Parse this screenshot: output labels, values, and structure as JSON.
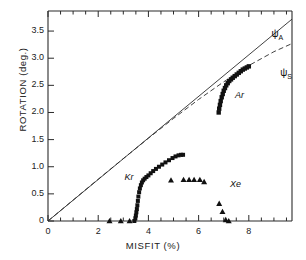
{
  "chart_data": {
    "type": "scatter",
    "title": "",
    "xlabel": "MISFIT (%)",
    "ylabel": "ROTATION (deg.)",
    "xlim": [
      0,
      9.72
    ],
    "ylim": [
      0,
      3.87
    ],
    "xticks_major": [
      0,
      2,
      4,
      6,
      8
    ],
    "xticks_major_labels": [
      "0",
      "2",
      "4",
      "6",
      "8"
    ],
    "xticks_minor": [
      0.5,
      1,
      1.5,
      2.5,
      3,
      3.5,
      4.5,
      5,
      5.5,
      6.5,
      7,
      7.5,
      8.5,
      9,
      9.5
    ],
    "yticks_major": [
      0,
      0.5,
      1.0,
      1.5,
      2.0,
      2.5,
      3.0,
      3.5
    ],
    "yticks_major_labels": [
      "0",
      "0.5",
      "1.0",
      "1.5",
      "2.0",
      "2.5",
      "3.0",
      "3.5"
    ],
    "grid": false,
    "legend": "inline-annotations",
    "series": [
      {
        "name": "psi_A",
        "label": "ψ",
        "label_sub": "A",
        "type": "line",
        "style": "solid",
        "color": "#2b2b2b",
        "points": [
          [
            0,
            0
          ],
          [
            9.72,
            3.72
          ]
        ]
      },
      {
        "name": "psi_S",
        "label": "ψ",
        "label_sub": "S",
        "type": "line",
        "style": "dashed",
        "color": "#2b2b2b",
        "points": [
          [
            0,
            0
          ],
          [
            1.0,
            0.385
          ],
          [
            2.0,
            0.77
          ],
          [
            3.0,
            1.15
          ],
          [
            4.0,
            1.525
          ],
          [
            5.0,
            1.89
          ],
          [
            6.0,
            2.24
          ],
          [
            7.0,
            2.565
          ],
          [
            8.0,
            2.865
          ],
          [
            9.0,
            3.12
          ],
          [
            9.72,
            3.27
          ]
        ]
      },
      {
        "name": "Kr",
        "label": "Kr",
        "type": "scatter",
        "marker": "square",
        "color": "#111111",
        "points": [
          [
            3.44,
            0.0
          ],
          [
            3.48,
            0.05
          ],
          [
            3.5,
            0.1
          ],
          [
            3.52,
            0.16
          ],
          [
            3.54,
            0.22
          ],
          [
            3.56,
            0.29
          ],
          [
            3.58,
            0.37
          ],
          [
            3.6,
            0.45
          ],
          [
            3.63,
            0.53
          ],
          [
            3.66,
            0.6
          ],
          [
            3.7,
            0.66
          ],
          [
            3.74,
            0.71
          ],
          [
            3.79,
            0.75
          ],
          [
            3.85,
            0.78
          ],
          [
            3.92,
            0.81
          ],
          [
            4.0,
            0.84
          ],
          [
            4.09,
            0.88
          ],
          [
            4.19,
            0.92
          ],
          [
            4.3,
            0.96
          ],
          [
            4.42,
            1.0
          ],
          [
            4.55,
            1.04
          ],
          [
            4.68,
            1.08
          ],
          [
            4.82,
            1.12
          ],
          [
            4.96,
            1.16
          ],
          [
            5.08,
            1.19
          ],
          [
            5.2,
            1.21
          ],
          [
            5.3,
            1.22
          ],
          [
            5.38,
            1.22
          ]
        ]
      },
      {
        "name": "Xe",
        "label": "Xe",
        "type": "scatter",
        "marker": "triangle",
        "color": "#111111",
        "points": [
          [
            2.45,
            0.0
          ],
          [
            2.9,
            0.0
          ],
          [
            3.25,
            0.0
          ],
          [
            4.9,
            0.75
          ],
          [
            5.4,
            0.76
          ],
          [
            5.62,
            0.76
          ],
          [
            5.82,
            0.76
          ],
          [
            6.05,
            0.76
          ],
          [
            6.22,
            0.72
          ],
          [
            6.82,
            0.32
          ],
          [
            6.95,
            0.17
          ],
          [
            7.08,
            0.02
          ],
          [
            7.2,
            0.0
          ]
        ]
      },
      {
        "name": "Ar",
        "label": "Ar",
        "type": "scatter",
        "marker": "square-dense",
        "color": "#111111",
        "points": [
          [
            6.8,
            2.0
          ],
          [
            6.82,
            2.07
          ],
          [
            6.85,
            2.14
          ],
          [
            6.88,
            2.21
          ],
          [
            6.92,
            2.28
          ],
          [
            6.96,
            2.34
          ],
          [
            7.0,
            2.4
          ],
          [
            7.05,
            2.45
          ],
          [
            7.1,
            2.5
          ],
          [
            7.16,
            2.54
          ],
          [
            7.22,
            2.58
          ],
          [
            7.29,
            2.61
          ],
          [
            7.36,
            2.64
          ],
          [
            7.44,
            2.67
          ],
          [
            7.52,
            2.7
          ],
          [
            7.6,
            2.73
          ],
          [
            7.68,
            2.76
          ],
          [
            7.76,
            2.79
          ],
          [
            7.84,
            2.81
          ],
          [
            7.92,
            2.83
          ],
          [
            8.0,
            2.85
          ]
        ]
      }
    ],
    "annotations": [
      {
        "name": "psi-a-label",
        "text": "ψ",
        "sub": "A",
        "x": 8.9,
        "y": 3.45
      },
      {
        "name": "psi-s-label",
        "text": "ψ",
        "sub": "S",
        "x": 9.25,
        "y": 2.72
      },
      {
        "name": "kr-label",
        "text": "Kr",
        "x": 3.05,
        "y": 0.8
      },
      {
        "name": "xe-label",
        "text": "Xe",
        "x": 7.25,
        "y": 0.66
      },
      {
        "name": "ar-label",
        "text": "Ar",
        "x": 7.45,
        "y": 2.3
      }
    ]
  },
  "axes": {
    "x_title": "MISFIT (%)",
    "y_title": "ROTATION (deg.)"
  }
}
